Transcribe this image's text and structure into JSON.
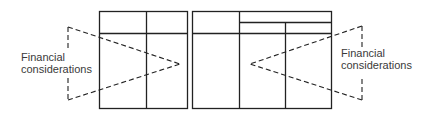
{
  "diagram": {
    "left_label": {
      "line1": "Financial",
      "line2": "considerations"
    },
    "right_label": {
      "line1": "Financial",
      "line2": "considerations"
    },
    "colors": {
      "line": "#222222",
      "text": "#3a3a3a",
      "background": "#ffffff"
    }
  }
}
